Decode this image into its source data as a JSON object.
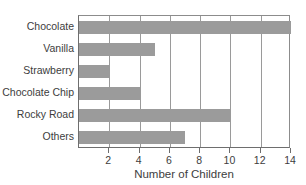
{
  "chart_data": {
    "type": "bar",
    "orientation": "horizontal",
    "title": "",
    "xlabel": "Number of Children",
    "ylabel": "",
    "categories": [
      "Chocolate",
      "Vanilla",
      "Strawberry",
      "Chocolate Chip",
      "Rocky Road",
      "Others"
    ],
    "values": [
      14,
      5,
      2,
      4,
      10,
      7
    ],
    "xlim": [
      0,
      14
    ],
    "xticks": [
      2,
      4,
      6,
      8,
      10,
      12,
      14
    ],
    "xtick_labels": [
      "2",
      "4",
      "6",
      "8",
      "10",
      "12",
      "14"
    ],
    "grid": "vertical",
    "legend": "none",
    "bar_color": "#9b9b9b",
    "axis_color": "#6e6e6e",
    "grid_color": "#9a9a9a",
    "background_color": "#ffffff"
  }
}
